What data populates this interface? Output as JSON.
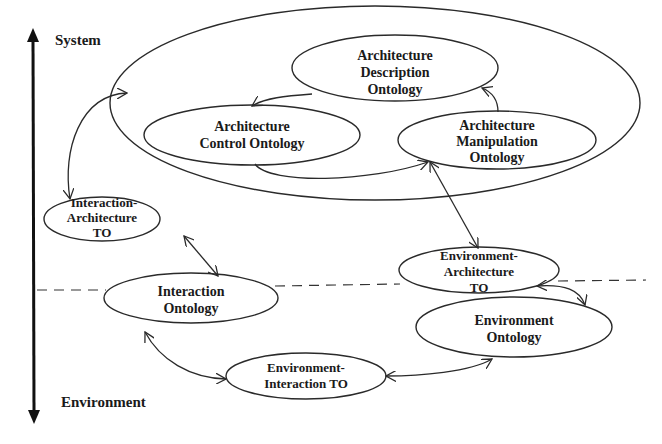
{
  "axis": {
    "top_label": "System",
    "bottom_label": "Environment"
  },
  "system_container": {
    "nodes": {
      "arch_description": [
        "Architecture",
        "Description",
        "Ontology"
      ],
      "arch_control": [
        "Architecture",
        "Control Ontology"
      ],
      "arch_manipulation": [
        "Architecture",
        "Manipulation",
        "Ontology"
      ]
    }
  },
  "nodes": {
    "interaction_architecture_to": [
      "Interaction-",
      "Architecture",
      "TO"
    ],
    "interaction_ontology": [
      "Interaction",
      "Ontology"
    ],
    "environment_architecture_to": [
      "Environment-",
      "Architecture",
      "TO"
    ],
    "environment_ontology": [
      "Environment",
      "Ontology"
    ],
    "environment_interaction_to": [
      "Environment-",
      "Interaction TO"
    ]
  },
  "edges": [
    {
      "from": "Architecture Description Ontology",
      "to": "Architecture Control Ontology",
      "direction": "one-way"
    },
    {
      "from": "Architecture Control Ontology",
      "to": "Architecture Manipulation Ontology",
      "direction": "one-way"
    },
    {
      "from": "Architecture Manipulation Ontology",
      "to": "Architecture Description Ontology",
      "direction": "one-way"
    },
    {
      "from": "System container",
      "to": "Interaction-Architecture TO",
      "direction": "bidirectional"
    },
    {
      "from": "Interaction-Architecture TO",
      "to": "Interaction Ontology",
      "direction": "bidirectional"
    },
    {
      "from": "Architecture Manipulation Ontology",
      "to": "Environment-Architecture TO",
      "direction": "bidirectional"
    },
    {
      "from": "Environment-Architecture TO",
      "to": "Environment Ontology",
      "direction": "bidirectional"
    },
    {
      "from": "Environment Ontology",
      "to": "Environment-Interaction TO",
      "direction": "bidirectional"
    },
    {
      "from": "Environment-Interaction TO",
      "to": "Interaction Ontology",
      "direction": "bidirectional"
    }
  ],
  "separator": "dashed system/environment boundary"
}
